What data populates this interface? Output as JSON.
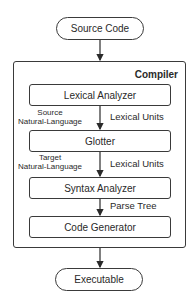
{
  "diagram": {
    "start": "Source Code",
    "end": "Executable",
    "container_title": "Compiler",
    "stages": [
      "Lexical Analyzer",
      "Glotter",
      "Syntax Analyzer",
      "Code Generator"
    ],
    "edges": [
      {
        "from": "Lexical Analyzer",
        "to": "Glotter",
        "label": "Lexical Units",
        "side_label": "Source\nNatural-Language",
        "side_line1": "Source",
        "side_line2": "Natural-Language"
      },
      {
        "from": "Glotter",
        "to": "Syntax Analyzer",
        "label": "Lexical Units",
        "side_label": "Target\nNatural-Language",
        "side_line1": "Target",
        "side_line2": "Natural-Language"
      },
      {
        "from": "Syntax Analyzer",
        "to": "Code Generator",
        "label": "Parse Tree"
      }
    ]
  }
}
